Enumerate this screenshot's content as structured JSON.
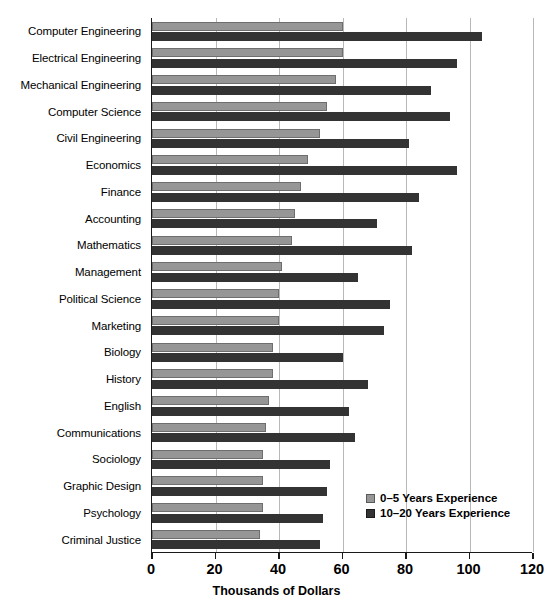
{
  "chart_data": {
    "type": "bar",
    "orientation": "horizontal",
    "title": "",
    "xlabel": "Thousands of Dollars",
    "ylabel": "",
    "xlim": [
      0,
      120
    ],
    "xticks": [
      0,
      20,
      40,
      60,
      80,
      100,
      120
    ],
    "xticklabels": [
      "0",
      "20",
      "40",
      "60",
      "80",
      "100",
      "120"
    ],
    "grid": "vertical",
    "legend_position": "lower-right-inside",
    "categories": [
      "Computer Engineering",
      "Electrical Engineering",
      "Mechanical Engineering",
      "Computer Science",
      "Civil Engineering",
      "Economics",
      "Finance",
      "Accounting",
      "Mathematics",
      "Management",
      "Political Science",
      "Marketing",
      "Biology",
      "History",
      "English",
      "Communications",
      "Sociology",
      "Graphic Design",
      "Psychology",
      "Criminal Justice"
    ],
    "series": [
      {
        "name": "0–5 Years Experience",
        "color": "#969696",
        "values": [
          60,
          60,
          58,
          55,
          53,
          49,
          47,
          45,
          44,
          41,
          40,
          40,
          38,
          38,
          37,
          36,
          35,
          35,
          35,
          34
        ]
      },
      {
        "name": "10–20 Years Experience",
        "color": "#333333",
        "values": [
          104,
          96,
          88,
          94,
          81,
          96,
          84,
          71,
          82,
          65,
          75,
          73,
          60,
          68,
          62,
          64,
          56,
          55,
          54,
          53
        ]
      }
    ]
  },
  "legend": {
    "items": [
      {
        "label": "0–5 Years Experience"
      },
      {
        "label": "10–20 Years Experience"
      }
    ]
  }
}
